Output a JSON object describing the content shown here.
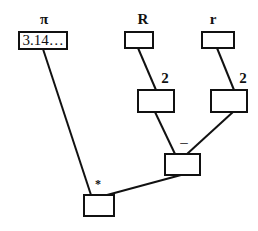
{
  "nodes": {
    "pi": {
      "label": "π",
      "value": "3.14…"
    },
    "R": {
      "label": "R",
      "value": ""
    },
    "r": {
      "label": "r",
      "value": ""
    },
    "R_squared": {
      "label": "2",
      "value": ""
    },
    "r_squared": {
      "label": "2",
      "value": ""
    },
    "subtract": {
      "label": "–",
      "value": ""
    },
    "multiply": {
      "label": "*",
      "value": ""
    }
  },
  "edges": [
    [
      "R",
      "R_squared"
    ],
    [
      "r",
      "r_squared"
    ],
    [
      "R_squared",
      "subtract"
    ],
    [
      "r_squared",
      "subtract"
    ],
    [
      "pi",
      "multiply"
    ],
    [
      "subtract",
      "multiply"
    ]
  ]
}
